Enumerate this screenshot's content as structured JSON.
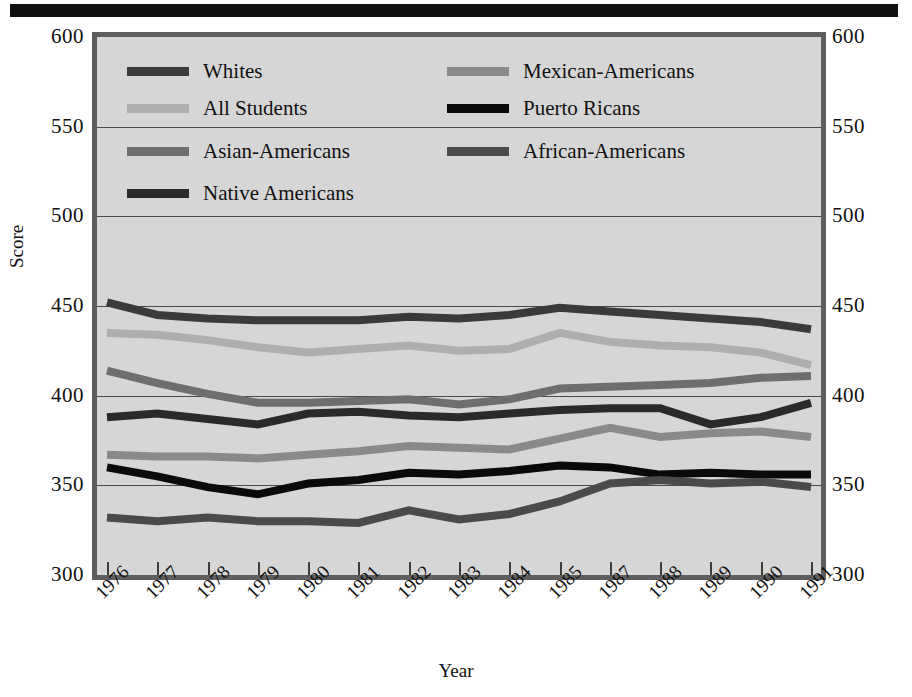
{
  "figure": {
    "top_rule": "solid-black-bar"
  },
  "axes": {
    "ylabel": "Score",
    "xlabel": "Year",
    "yticks": [
      300,
      350,
      400,
      450,
      500,
      550,
      600
    ],
    "ylim": [
      300,
      600
    ],
    "grid": "horizontal",
    "tick_labels_left": [
      "600",
      "550",
      "500",
      "450",
      "400",
      "350",
      "300"
    ],
    "tick_labels_right": [
      "600",
      "550",
      "500",
      "450",
      "400",
      "350",
      "300"
    ]
  },
  "legend": {
    "position": "upper-left-inside-plot",
    "rows": [
      [
        {
          "label": "Whites",
          "color": "#3a3a3a"
        },
        {
          "label": "Mexican-Americans",
          "color": "#8a8a8a"
        }
      ],
      [
        {
          "label": "All Students",
          "color": "#aeaeae"
        },
        {
          "label": "Puerto Ricans",
          "color": "#0a0a0a"
        }
      ],
      [
        {
          "label": "Asian-Americans",
          "color": "#6e6e6e"
        },
        {
          "label": "African-Americans",
          "color": "#4a4a4a"
        }
      ],
      [
        {
          "label": "Native Americans",
          "color": "#2a2a2a"
        },
        {
          "label": "",
          "color": ""
        }
      ]
    ]
  },
  "chart_data": {
    "type": "line",
    "title": "",
    "xlabel": "Year",
    "ylabel": "Score",
    "ylim": [
      300,
      600
    ],
    "grid": true,
    "legend_position": "upper-left",
    "categories": [
      "1976",
      "1977",
      "1978",
      "1979",
      "1980",
      "1981",
      "1982",
      "1983",
      "1984",
      "1985",
      "1987",
      "1988",
      "1989",
      "1990",
      "1991"
    ],
    "series": [
      {
        "name": "Whites",
        "color": "#3a3a3a",
        "values": [
          452,
          445,
          443,
          442,
          442,
          442,
          444,
          443,
          445,
          449,
          447,
          445,
          443,
          441,
          437
        ]
      },
      {
        "name": "All Students",
        "color": "#aeaeae",
        "values": [
          435,
          434,
          431,
          427,
          424,
          426,
          428,
          425,
          426,
          435,
          430,
          428,
          427,
          424,
          417
        ]
      },
      {
        "name": "Asian-Americans",
        "color": "#6e6e6e",
        "values": [
          414,
          407,
          401,
          396,
          396,
          397,
          398,
          395,
          398,
          404,
          405,
          406,
          407,
          410,
          411
        ]
      },
      {
        "name": "Native Americans",
        "color": "#2a2a2a",
        "values": [
          388,
          390,
          387,
          384,
          390,
          391,
          389,
          388,
          390,
          392,
          393,
          393,
          384,
          388,
          396
        ]
      },
      {
        "name": "Mexican-Americans",
        "color": "#8a8a8a",
        "values": [
          367,
          366,
          366,
          365,
          367,
          369,
          372,
          371,
          370,
          376,
          382,
          377,
          379,
          380,
          377
        ]
      },
      {
        "name": "Puerto Ricans",
        "color": "#0a0a0a",
        "values": [
          360,
          355,
          349,
          345,
          351,
          353,
          357,
          356,
          358,
          361,
          360,
          356,
          357,
          356,
          356
        ]
      },
      {
        "name": "African-Americans",
        "color": "#4a4a4a",
        "values": [
          332,
          330,
          332,
          330,
          330,
          329,
          336,
          331,
          334,
          341,
          351,
          353,
          351,
          352,
          349
        ]
      }
    ]
  }
}
